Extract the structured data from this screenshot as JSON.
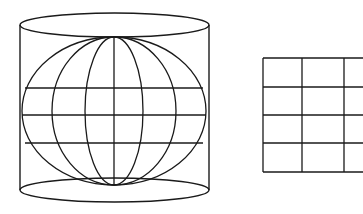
{
  "diagram": {
    "stroke_color": "#1a1a1a",
    "background": "#ffffff",
    "parts": [
      {
        "name": "cylinder-with-globe",
        "meridians": 7,
        "parallels": 3
      },
      {
        "name": "unrolled-grid",
        "columns": 3,
        "rows": 4
      }
    ]
  }
}
